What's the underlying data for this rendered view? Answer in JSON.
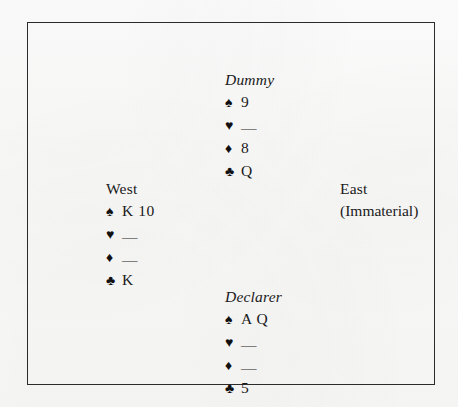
{
  "diagram": {
    "kind": "bridge-deal-diagram",
    "suit_symbols": {
      "spade": "♠",
      "heart": "♥",
      "diamond": "♦",
      "club": "♣"
    },
    "void_mark": "—",
    "frame_color": "#2b2b2b",
    "ink_color": "#1a1a1a",
    "paper_color": "#fdfdfd"
  },
  "hands": {
    "dummy": {
      "label": "Dummy",
      "spades": "9",
      "hearts": "—",
      "diamonds": "8",
      "clubs": "Q"
    },
    "west": {
      "label": "West",
      "spades": "K 10",
      "hearts": "—",
      "diamonds": "—",
      "clubs": "K"
    },
    "east": {
      "label": "East",
      "note": "(Immaterial)"
    },
    "declarer": {
      "label": "Declarer",
      "spades": "A Q",
      "hearts": "—",
      "diamonds": "—",
      "clubs": "5"
    }
  }
}
